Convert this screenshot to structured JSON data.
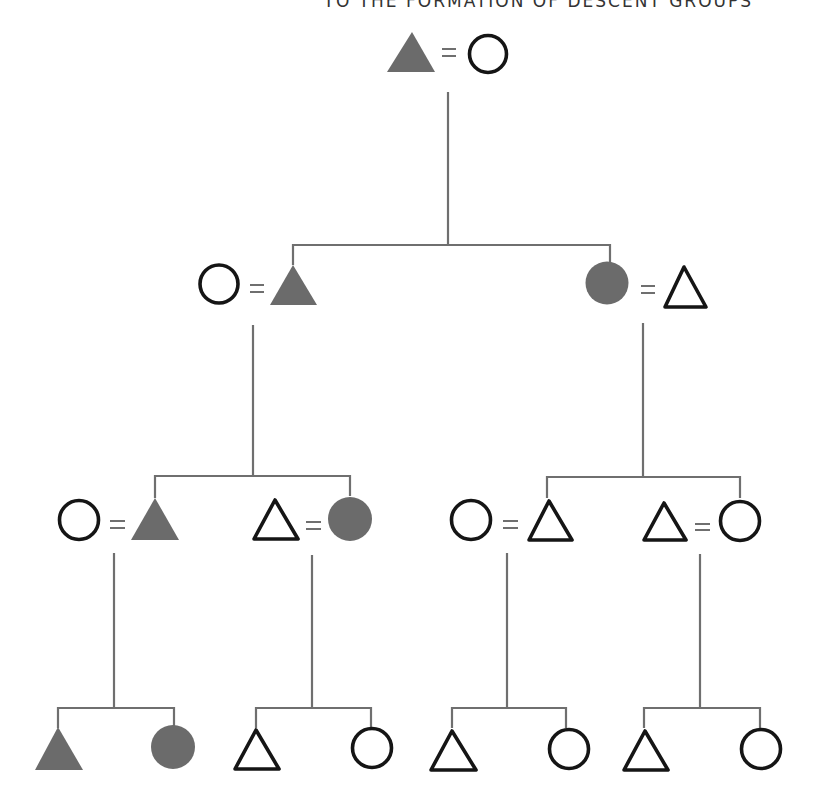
{
  "header": {
    "title": "TO THE FORMATION OF DESCENT GROUPS",
    "clipped": true
  },
  "legend_semantics": {
    "triangle": "male",
    "circle": "female",
    "equals_sign": "marriage",
    "filled": "member of descent group (shaded)",
    "outline": "non-member"
  },
  "colors": {
    "filled_symbol": "#6b6b6b",
    "outline_stroke": "#151515",
    "connector_line": "#6f6f6f",
    "background": "#ffffff"
  },
  "generations": [
    {
      "level": 1,
      "couples": [
        {
          "id": "g1-c1",
          "left": {
            "shape": "triangle",
            "filled": true
          },
          "right": {
            "shape": "circle",
            "filled": false
          }
        }
      ]
    },
    {
      "level": 2,
      "couples": [
        {
          "id": "g2-c1",
          "left": {
            "shape": "circle",
            "filled": false
          },
          "right": {
            "shape": "triangle",
            "filled": true
          }
        },
        {
          "id": "g2-c2",
          "left": {
            "shape": "circle",
            "filled": true
          },
          "right": {
            "shape": "triangle",
            "filled": false
          }
        }
      ]
    },
    {
      "level": 3,
      "couples": [
        {
          "id": "g3-c1",
          "left": {
            "shape": "circle",
            "filled": false
          },
          "right": {
            "shape": "triangle",
            "filled": true
          }
        },
        {
          "id": "g3-c2",
          "left": {
            "shape": "triangle",
            "filled": false
          },
          "right": {
            "shape": "circle",
            "filled": true
          }
        },
        {
          "id": "g3-c3",
          "left": {
            "shape": "circle",
            "filled": false
          },
          "right": {
            "shape": "triangle",
            "filled": false
          }
        },
        {
          "id": "g3-c4",
          "left": {
            "shape": "triangle",
            "filled": false
          },
          "right": {
            "shape": "circle",
            "filled": false
          }
        }
      ]
    },
    {
      "level": 4,
      "sibling_sets": [
        {
          "id": "g4-s1",
          "children": [
            {
              "shape": "triangle",
              "filled": true
            },
            {
              "shape": "circle",
              "filled": true
            }
          ]
        },
        {
          "id": "g4-s2",
          "children": [
            {
              "shape": "triangle",
              "filled": false
            },
            {
              "shape": "circle",
              "filled": false
            }
          ]
        },
        {
          "id": "g4-s3",
          "children": [
            {
              "shape": "triangle",
              "filled": false
            },
            {
              "shape": "circle",
              "filled": false
            }
          ]
        },
        {
          "id": "g4-s4",
          "children": [
            {
              "shape": "triangle",
              "filled": false
            },
            {
              "shape": "circle",
              "filled": false
            }
          ]
        }
      ]
    }
  ]
}
